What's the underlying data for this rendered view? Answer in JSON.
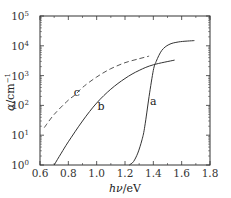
{
  "chart_data": {
    "type": "line",
    "title": "",
    "xlabel": "hν/eV",
    "ylabel": "α/cm⁻¹",
    "xlim": [
      0.6,
      1.8
    ],
    "ylim": [
      1,
      100000
    ],
    "yscale": "log",
    "grid": false,
    "legend": "none (curves labeled inline: a, b, c)",
    "x_ticks": [
      "0.6",
      "0.8",
      "1.0",
      "1.2",
      "1.4",
      "1.6",
      "1.8"
    ],
    "y_ticks": [
      "10^0",
      "10^1",
      "10^2",
      "10^3",
      "10^4",
      "10^5"
    ],
    "series": [
      {
        "name": "a",
        "style": "solid",
        "x": [
          1.23,
          1.26,
          1.29,
          1.32,
          1.34,
          1.37,
          1.4,
          1.42,
          1.46,
          1.51,
          1.58,
          1.69
        ],
        "y": [
          1,
          1.3,
          2.5,
          7,
          20,
          200,
          1500,
          3000,
          7000,
          11000,
          13500,
          15000
        ]
      },
      {
        "name": "b",
        "style": "solid",
        "x": [
          0.7,
          0.75,
          0.8,
          0.9,
          1.0,
          1.1,
          1.2,
          1.3,
          1.4,
          1.55
        ],
        "y": [
          1,
          2.5,
          6,
          30,
          120,
          350,
          800,
          1500,
          2300,
          3300
        ]
      },
      {
        "name": "c",
        "style": "dashed",
        "x": [
          0.63,
          0.7,
          0.8,
          0.85,
          0.9,
          1.0,
          1.1,
          1.2,
          1.3,
          1.37
        ],
        "y": [
          18,
          50,
          150,
          230,
          400,
          900,
          1700,
          2700,
          3700,
          4500
        ]
      }
    ],
    "annotations": [
      {
        "text": "a",
        "x": 1.4,
        "y": 100
      },
      {
        "text": "b",
        "x": 1.03,
        "y": 70
      },
      {
        "text": "c",
        "x": 0.86,
        "y": 200
      }
    ]
  },
  "labels": {
    "x_axis_title_main": "hν",
    "x_axis_title_unit": "/eV",
    "y_axis_title_main": "α",
    "y_axis_title_unit": "/cm",
    "y_axis_title_exp": "−1"
  }
}
